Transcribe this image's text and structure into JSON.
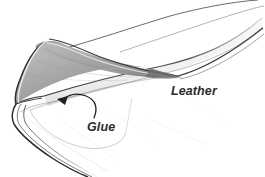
{
  "figure": {
    "type": "pencil-line-illustration",
    "background_color": "#ffffff",
    "ink_color": "#2b2b2b",
    "canvas": {
      "width": 265,
      "height": 177
    }
  },
  "labels": {
    "leather": {
      "text": "Leather",
      "style": "italic",
      "x": 171,
      "y": 84,
      "font_size": 12.5,
      "color": "#2b2b2b"
    },
    "glue": {
      "text": "Glue",
      "style": "italic",
      "x": 87,
      "y": 120,
      "font_size": 12.5,
      "color": "#2b2b2b"
    }
  },
  "annotations": {
    "glue_arrow": {
      "name": "curved-leader-arrow",
      "from_label": "Glue",
      "points_to": "glued-inner-surface",
      "arrow_tip": {
        "x": 58,
        "y": 100
      },
      "color": "#2b2b2b"
    }
  },
  "shapes": {
    "flap": {
      "name": "folded-leather-flap",
      "shading": "gradient-dark-to-light",
      "dark_color": "#8d8d8d",
      "light_color": "#d8d8d8"
    },
    "strip": {
      "name": "leather-strip-body",
      "fill_color": "#f4f4f4",
      "edge_color": "#3a3a3a"
    },
    "glue_area": {
      "name": "glue-application-outline",
      "outline_color": "#8a8a8a"
    }
  }
}
